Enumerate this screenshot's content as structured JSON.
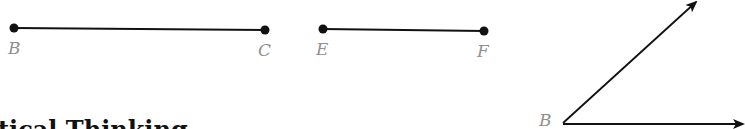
{
  "figure": {
    "segments": [
      {
        "name": "BC",
        "start": {
          "label": "B",
          "x": 14,
          "y": 28
        },
        "end": {
          "label": "C",
          "x": 265,
          "y": 30
        }
      },
      {
        "name": "EF",
        "start": {
          "label": "E",
          "x": 323,
          "y": 29
        },
        "end": {
          "label": "F",
          "x": 484,
          "y": 31
        }
      }
    ],
    "angle": {
      "vertex": {
        "label": "B",
        "x": 563,
        "y": 123
      },
      "ray1_tip": {
        "x": 696,
        "y": 2
      },
      "ray2_tip": {
        "x": 745,
        "y": 124
      }
    },
    "labels": {
      "seg1_start": "B",
      "seg1_end": "C",
      "seg2_start": "E",
      "seg2_end": "F",
      "angle_vertex": "B"
    }
  },
  "heading": {
    "text": "tical Thinking"
  },
  "colors": {
    "line": "#111111",
    "label": "#8f8f8f",
    "background": "#ffffff"
  }
}
